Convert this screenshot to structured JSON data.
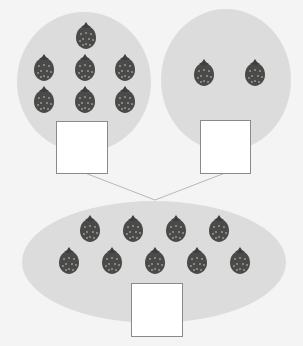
{
  "diagram": {
    "colors": {
      "background": "#f4f4f4",
      "group_fill": "#dcdcdc",
      "box_fill": "#ffffff",
      "box_stroke": "#8a8a8a",
      "line": "#b8b8b8",
      "strawberry": "#4a4a48",
      "strawberry_dots": "#d8d8d8"
    },
    "groups": [
      {
        "name": "left-part",
        "strawberry_count": 7,
        "answer_box_value": ""
      },
      {
        "name": "right-part",
        "strawberry_count": 2,
        "answer_box_value": ""
      },
      {
        "name": "whole",
        "strawberry_count": 9,
        "answer_box_value": ""
      }
    ],
    "icon": "strawberry-icon"
  }
}
